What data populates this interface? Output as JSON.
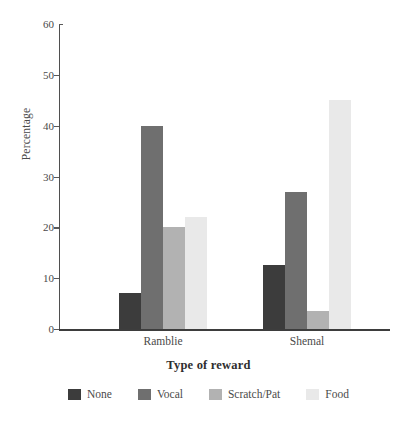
{
  "chart_data": {
    "type": "bar",
    "title": "",
    "xlabel": "Type of reward",
    "ylabel": "Percentage",
    "categories": [
      "Ramblie",
      "Shemal"
    ],
    "series": [
      {
        "name": "None",
        "values": [
          7,
          12.5
        ],
        "color": "#3c3c3c"
      },
      {
        "name": "Vocal",
        "values": [
          40,
          27
        ],
        "color": "#6f6f6f"
      },
      {
        "name": "Scratch/Pat",
        "values": [
          20,
          3.5
        ],
        "color": "#b2b2b2"
      },
      {
        "name": "Food",
        "values": [
          22,
          45
        ],
        "color": "#e9e9e9"
      }
    ],
    "ylim": [
      0,
      60
    ],
    "yticks": [
      0,
      10,
      20,
      30,
      40,
      50,
      60
    ],
    "ytick_labels": [
      "0",
      "10",
      "20",
      "30",
      "40",
      "50",
      "60"
    ],
    "grid": false,
    "legend_position": "bottom"
  },
  "axis": {
    "y_label": "Percentage",
    "x_label": "Type of reward"
  }
}
